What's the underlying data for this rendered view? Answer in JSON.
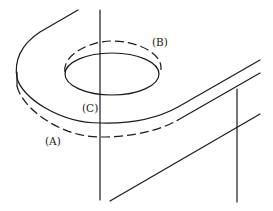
{
  "figure": {
    "labels": {
      "a": "(A)",
      "b": "(B)",
      "c": "(C)"
    },
    "line_styles": {
      "solid": "visible edge",
      "dashed": "hidden edge"
    },
    "colors": {
      "ink": "#1a1a1a",
      "background": "#ffffff"
    }
  }
}
